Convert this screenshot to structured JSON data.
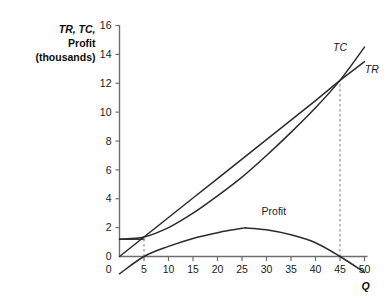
{
  "chart_data": {
    "type": "line",
    "title": "",
    "ylabel_lines": [
      "TR, TC,",
      "Profit",
      "(thousands)"
    ],
    "ylabel_italic_part": "TR, TC,",
    "xlabel": "Q",
    "xlim": [
      0,
      50
    ],
    "ylim": [
      0,
      16
    ],
    "ylim_display_min": -1.6,
    "xticks": [
      0,
      5,
      10,
      15,
      20,
      25,
      30,
      35,
      40,
      45,
      50
    ],
    "xtick_labels": [
      "0",
      "5",
      "10",
      "15",
      "20",
      "25",
      "30",
      "35",
      "40",
      "45",
      "50"
    ],
    "yticks": [
      0,
      2,
      4,
      6,
      8,
      10,
      12,
      14,
      16
    ],
    "ytick_labels": [
      "0",
      "2",
      "4",
      "6",
      "8",
      "10",
      "12",
      "14",
      "16"
    ],
    "grid": false,
    "legend_position": "inline-labels",
    "series": [
      {
        "name": "TR",
        "label": "TR",
        "label_style": "italic",
        "label_x": 51.5,
        "label_y": 12.7,
        "kind": "straight-line",
        "x": [
          0,
          5,
          10,
          15,
          20,
          25,
          30,
          35,
          40,
          45,
          50
        ],
        "values": [
          0.0,
          1.35,
          2.7,
          4.05,
          5.4,
          6.75,
          8.1,
          9.45,
          10.8,
          12.2,
          13.5
        ]
      },
      {
        "name": "TC",
        "label": "TC",
        "label_style": "italic",
        "label_x": 45.0,
        "label_y": 14.2,
        "kind": "curve",
        "x": [
          0,
          5,
          10,
          15,
          20,
          25,
          30,
          35,
          40,
          45,
          50
        ],
        "values": [
          1.2,
          1.35,
          2.0,
          3.0,
          4.2,
          5.5,
          7.0,
          8.6,
          10.3,
          12.2,
          14.5
        ]
      },
      {
        "name": "Profit",
        "label": "Profit",
        "label_style": "regular",
        "label_x": 31.5,
        "label_y": 2.9,
        "kind": "curve",
        "x": [
          0,
          5,
          10,
          15,
          20,
          25,
          26,
          30,
          35,
          40,
          45,
          50
        ],
        "values": [
          -1.2,
          0.0,
          0.7,
          1.25,
          1.65,
          1.95,
          1.97,
          1.85,
          1.5,
          0.95,
          0.0,
          -1.1
        ]
      }
    ],
    "annotations": [
      {
        "name": "fixed-cost-segment",
        "kind": "horizontal-line",
        "y": 1.2,
        "x_from": 0,
        "x_to": 5.1
      },
      {
        "name": "breakeven-low-dashed",
        "kind": "vertical-dashed",
        "x": 5,
        "y_from": 0,
        "y_to": 1.4
      },
      {
        "name": "breakeven-high-dashed",
        "kind": "vertical-dashed",
        "x": 45,
        "y_from": 0,
        "y_to": 12.2
      }
    ],
    "colors": {
      "axis": "#6e6e6e",
      "curve": "#2b2b2b",
      "dashed": "#8a8a8a",
      "text": "#1a1a1a",
      "background": "#ffffff"
    }
  }
}
